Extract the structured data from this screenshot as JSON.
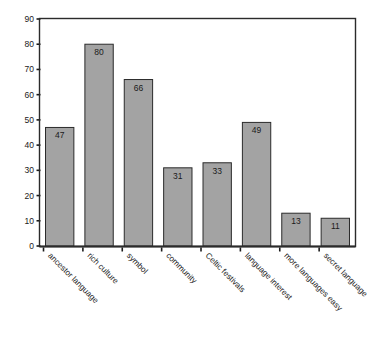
{
  "chart_data": {
    "type": "bar",
    "title": "",
    "subtitle": "",
    "xlabel": "",
    "ylabel": "",
    "categories": [
      "ancestor language",
      "rich culture",
      "symbol",
      "community",
      "Celtic festivals",
      "language interest",
      "more languages easy",
      "secret language"
    ],
    "values": [
      47,
      80,
      66,
      31,
      33,
      49,
      13,
      11
    ],
    "value_labels": [
      "47",
      "80",
      "66",
      "31",
      "33",
      "49",
      "13",
      "11"
    ],
    "ylim": [
      0,
      90
    ],
    "ytick_labels": [
      "0",
      "10",
      "20",
      "30",
      "40",
      "50",
      "60",
      "70",
      "80",
      "90"
    ],
    "ytick_values": [
      0,
      10,
      20,
      30,
      40,
      50,
      60,
      70,
      80,
      90
    ],
    "grid": false,
    "legend": false,
    "legend_position": "none",
    "xtick_rotation_degrees": -45,
    "value_label_position": "inside-top"
  },
  "style": {
    "bar_fill": "#a3a3a3",
    "bar_stroke": "#2b2b2b",
    "axis_color": "#2b2b2b",
    "text_color": "#1a1a1a",
    "background": "#ffffff"
  }
}
